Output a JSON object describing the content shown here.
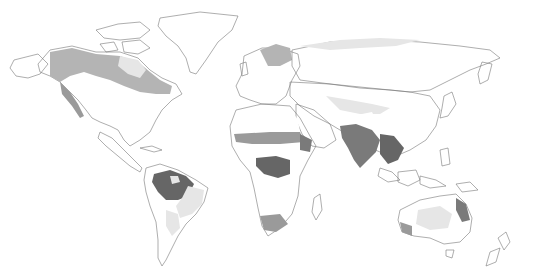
{
  "map": {
    "type": "world-vegetation-zones",
    "style": "grayscale",
    "palette": {
      "background": "#ffffff",
      "outline": "#777777",
      "ice_tundra": "#ffffff",
      "very_light": "#e6e6e6",
      "light": "#d2d2d2",
      "medium": "#b4b4b4",
      "medium_dark": "#9a9a9a",
      "dark": "#7a7a7a",
      "darkest": "#666666"
    },
    "regions": [
      {
        "name": "north-america-boreal",
        "shade": "medium"
      },
      {
        "name": "north-america-temperate",
        "shade": "light"
      },
      {
        "name": "central-america",
        "shade": "dark"
      },
      {
        "name": "south-america-amazon",
        "shade": "darkest"
      },
      {
        "name": "south-america-savanna",
        "shade": "very_light"
      },
      {
        "name": "south-america-andes",
        "shade": "medium"
      },
      {
        "name": "europe",
        "shade": "light"
      },
      {
        "name": "russia-boreal",
        "shade": "medium"
      },
      {
        "name": "central-asia-steppe",
        "shade": "light"
      },
      {
        "name": "sahara",
        "shade": "ice_tundra"
      },
      {
        "name": "sahel",
        "shade": "dark"
      },
      {
        "name": "congo-rainforest",
        "shade": "darkest"
      },
      {
        "name": "southern-africa",
        "shade": "very_light"
      },
      {
        "name": "south-asia",
        "shade": "dark"
      },
      {
        "name": "east-asia",
        "shade": "light"
      },
      {
        "name": "southeast-asia-islands",
        "shade": "darkest"
      },
      {
        "name": "australia-interior",
        "shade": "very_light"
      },
      {
        "name": "australia-coast",
        "shade": "dark"
      },
      {
        "name": "greenland",
        "shade": "ice_tundra"
      },
      {
        "name": "canadian-arctic",
        "shade": "ice_tundra"
      }
    ],
    "caption_visible": false
  }
}
